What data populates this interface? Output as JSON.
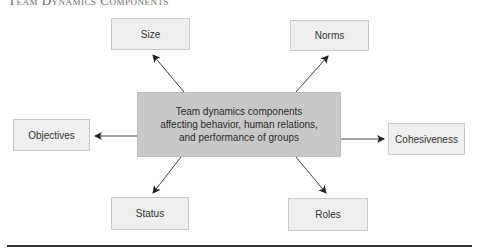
{
  "heading": {
    "text": "Team Dynamics Components"
  },
  "center": {
    "lines": [
      "Team dynamics components",
      "affecting behavior, human relations,",
      "and performance of groups"
    ]
  },
  "nodes": {
    "size": {
      "label": "Size"
    },
    "norms": {
      "label": "Norms"
    },
    "objectives": {
      "label": "Objectives"
    },
    "cohesiveness": {
      "label": "Cohesiveness"
    },
    "status": {
      "label": "Status"
    },
    "roles": {
      "label": "Roles"
    }
  },
  "colors": {
    "center_fill": "#c8c8c8",
    "node_fill": "#efefef",
    "node_border": "#c9c9c9",
    "arrow": "#444444",
    "rule": "#333333"
  }
}
